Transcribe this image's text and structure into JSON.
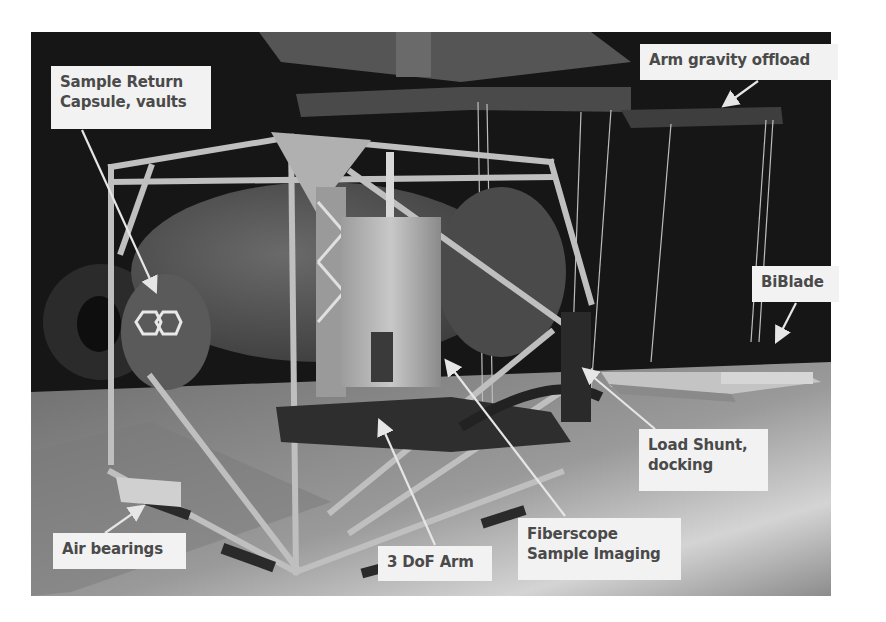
{
  "figure": {
    "colors": {
      "background": "#ffffff",
      "label_fill": "#f2f2f2",
      "label_text": "#4a4a4a",
      "arrow": "#e6e6e6",
      "backdrop": "#1a1a1a",
      "floor": "#8a8a8a"
    },
    "labels": [
      {
        "id": "sample-return-capsule",
        "lines": [
          "Sample Return",
          "Capsule, vaults"
        ]
      },
      {
        "id": "arm-gravity-offload",
        "lines": [
          "Arm gravity offload"
        ]
      },
      {
        "id": "biblade",
        "lines": [
          "BiBlade"
        ]
      },
      {
        "id": "load-shunt-docking",
        "lines": [
          "Load Shunt,",
          "docking"
        ]
      },
      {
        "id": "air-bearings",
        "lines": [
          "Air bearings"
        ]
      },
      {
        "id": "3dof-arm",
        "lines": [
          "3 DoF Arm"
        ]
      },
      {
        "id": "fiberscope-sample-imaging",
        "lines": [
          "Fiberscope",
          "Sample Imaging"
        ]
      }
    ]
  }
}
